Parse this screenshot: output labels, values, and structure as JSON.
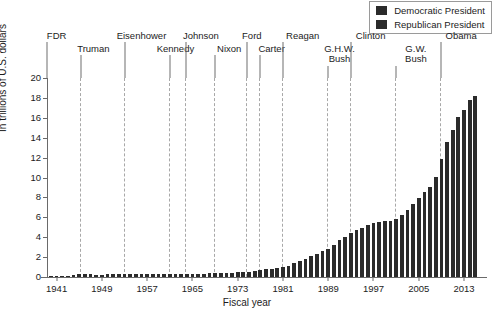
{
  "chart_data": {
    "type": "bar",
    "title": "",
    "xlabel": "Fiscal year",
    "ylabel": "In trillions of U.S. dollars",
    "ylim": [
      0,
      20
    ],
    "ytick_values": [
      0,
      2,
      4,
      6,
      8,
      10,
      12,
      14,
      16,
      18,
      20
    ],
    "xtick_values": [
      1941,
      1949,
      1957,
      1965,
      1973,
      1981,
      1989,
      1997,
      2005,
      2013
    ],
    "xlim": [
      1939.3,
      2016.0
    ],
    "grid": false,
    "legend_position": "top-right",
    "x": [
      1940,
      1941,
      1942,
      1943,
      1944,
      1945,
      1946,
      1947,
      1948,
      1949,
      1950,
      1951,
      1952,
      1953,
      1954,
      1955,
      1956,
      1957,
      1958,
      1959,
      1960,
      1961,
      1962,
      1963,
      1964,
      1965,
      1966,
      1967,
      1968,
      1969,
      1970,
      1971,
      1972,
      1973,
      1974,
      1975,
      1976,
      1977,
      1978,
      1979,
      1980,
      1981,
      1982,
      1983,
      1984,
      1985,
      1986,
      1987,
      1988,
      1989,
      1990,
      1991,
      1992,
      1993,
      1994,
      1995,
      1996,
      1997,
      1998,
      1999,
      2000,
      2001,
      2002,
      2003,
      2004,
      2005,
      2006,
      2007,
      2008,
      2009,
      2010,
      2011,
      2012,
      2013,
      2014,
      2015
    ],
    "values": [
      0.05,
      0.06,
      0.08,
      0.14,
      0.2,
      0.26,
      0.27,
      0.26,
      0.25,
      0.25,
      0.26,
      0.26,
      0.26,
      0.27,
      0.27,
      0.27,
      0.27,
      0.27,
      0.28,
      0.29,
      0.29,
      0.29,
      0.3,
      0.31,
      0.32,
      0.32,
      0.33,
      0.34,
      0.37,
      0.37,
      0.38,
      0.41,
      0.44,
      0.46,
      0.49,
      0.54,
      0.63,
      0.71,
      0.78,
      0.83,
      0.91,
      1.0,
      1.14,
      1.37,
      1.56,
      1.82,
      2.12,
      2.35,
      2.6,
      2.86,
      3.23,
      3.67,
      4.06,
      4.41,
      4.69,
      4.97,
      5.22,
      5.41,
      5.53,
      5.66,
      5.67,
      5.81,
      6.23,
      6.78,
      7.38,
      7.93,
      8.51,
      9.01,
      10.02,
      11.91,
      13.56,
      14.79,
      16.07,
      16.74,
      17.82,
      18.15
    ],
    "series": [
      {
        "name": "Democratic President",
        "color": "#2b2b2b"
      },
      {
        "name": "Republican President",
        "color": "#2b2b2b"
      }
    ]
  },
  "legend": {
    "items": [
      {
        "label": "Democratic President",
        "color": "#2b2b2b"
      },
      {
        "label": "Republican President",
        "color": "#2b2b2b"
      }
    ]
  },
  "presidents": [
    {
      "name": "FDR",
      "lines": [
        "FDR"
      ],
      "row": 0,
      "x": 1941.0,
      "start": 1939.3
    },
    {
      "name": "Truman",
      "lines": [
        "Truman"
      ],
      "row": 1,
      "x": 1947.5,
      "start": 1945.3
    },
    {
      "name": "Eisenhower",
      "lines": [
        "Eisenhower"
      ],
      "row": 0,
      "x": 1956.0,
      "start": 1953.0
    },
    {
      "name": "Kennedy",
      "lines": [
        "Kennedy"
      ],
      "row": 1,
      "x": 1962.0,
      "start": 1961.0
    },
    {
      "name": "Johnson",
      "lines": [
        "Johnson"
      ],
      "row": 0,
      "x": 1966.5,
      "start": 1963.8
    },
    {
      "name": "Nixon",
      "lines": [
        "Nixon"
      ],
      "row": 1,
      "x": 1971.5,
      "start": 1969.0
    },
    {
      "name": "Ford",
      "lines": [
        "Ford"
      ],
      "row": 0,
      "x": 1975.5,
      "start": 1974.6
    },
    {
      "name": "Carter",
      "lines": [
        "Carter"
      ],
      "row": 1,
      "x": 1979.0,
      "start": 1977.0
    },
    {
      "name": "Reagan",
      "lines": [
        "Reagan"
      ],
      "row": 0,
      "x": 1984.5,
      "start": 1981.0
    },
    {
      "name": "G.H.W. Bush",
      "lines": [
        "G.H.W.",
        "Bush"
      ],
      "row": 1,
      "x": 1991.0,
      "start": 1989.0
    },
    {
      "name": "Clinton",
      "lines": [
        "Clinton"
      ],
      "row": 0,
      "x": 1996.5,
      "start": 1993.0
    },
    {
      "name": "G.W. Bush",
      "lines": [
        "G.W.",
        "Bush"
      ],
      "row": 1,
      "x": 2004.5,
      "start": 2001.0
    },
    {
      "name": "Obama",
      "lines": [
        "Obama"
      ],
      "row": 0,
      "x": 2012.5,
      "start": 2009.0
    }
  ],
  "dividers": [
    1945.3,
    1953.0,
    1961.0,
    1963.8,
    1969.0,
    1974.6,
    1977.0,
    1981.0,
    1989.0,
    1993.0,
    2001.0,
    2009.0
  ]
}
